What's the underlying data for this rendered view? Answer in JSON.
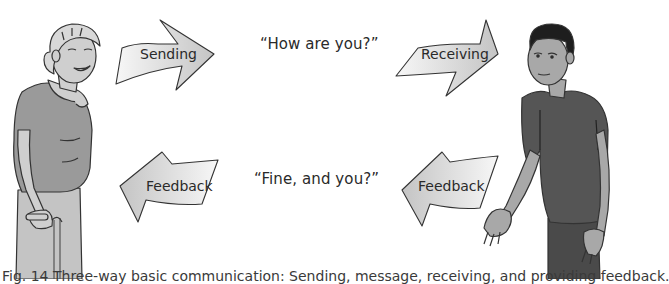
{
  "diagram": {
    "title": "Three-way basic communication",
    "arrows": {
      "sending": {
        "label": "Sending",
        "direction": "right"
      },
      "receiving": {
        "label": "Receiving",
        "direction": "right"
      },
      "feedback_left": {
        "label": "Feedback",
        "direction": "left"
      },
      "feedback_right": {
        "label": "Feedback",
        "direction": "left"
      }
    },
    "messages": {
      "top": "“How are you?”",
      "bottom": "“Fine, and you?”"
    },
    "people": {
      "left": "elderly woman with cane",
      "right": "young man"
    },
    "caption": "Fig. 14  Three-way basic communication: Sending, message, receiving, and providing feedback."
  },
  "colors": {
    "arrow_fill_light": "#f4f4f4",
    "arrow_fill_dark": "#c8c8c8",
    "outline": "#333333",
    "woman_shirt": "#9a9a9a",
    "woman_pants": "#c4c4c4",
    "skin_light": "#cfcfcf",
    "man_shirt": "#555555",
    "man_skin": "#a8a8a8"
  }
}
